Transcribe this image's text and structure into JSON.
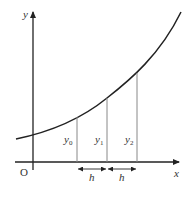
{
  "diagram": {
    "type": "trapezoidal-rule-ordinates",
    "axes": {
      "x_label": "x",
      "y_label": "y",
      "origin_label": "O"
    },
    "curve": {
      "description": "increasing convex curve y = f(x)"
    },
    "ordinates": [
      {
        "label": "y",
        "subscript": "0"
      },
      {
        "label": "y",
        "subscript": "1"
      },
      {
        "label": "y",
        "subscript": "2"
      }
    ],
    "intervals": [
      {
        "label": "h"
      },
      {
        "label": "h"
      }
    ],
    "colors": {
      "axis": "#222222",
      "curve": "#222222",
      "ordinate": "#888888",
      "text": "#333333"
    }
  }
}
